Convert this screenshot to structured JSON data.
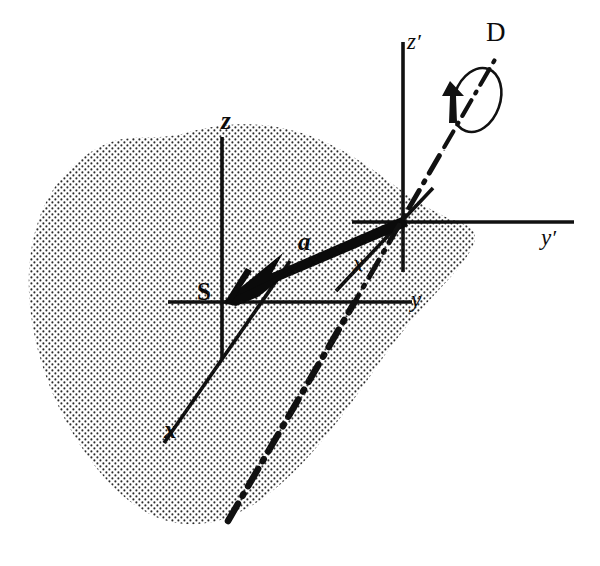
{
  "figure": {
    "background_color": "#ffffff",
    "ink_color": "#111111",
    "stipple_color": "#2b2b2b",
    "width": 600,
    "height": 566
  },
  "labels": {
    "origin_unprimed": "S",
    "axis_z_unprimed": "z",
    "axis_y_unprimed": "y",
    "axis_x_unprimed": "x",
    "axis_z_primed": "z",
    "axis_y_primed": "y",
    "axis_x_primed": "x",
    "prime_mark": "′",
    "vector_a": "a",
    "rotation_axis": "D"
  },
  "geometry": {
    "origin_unprimed": {
      "x": 222,
      "y": 302
    },
    "origin_primed": {
      "x": 403,
      "y": 222
    },
    "vector_a": {
      "tail": {
        "x": 403,
        "y": 222
      },
      "tip": {
        "x": 224,
        "y": 301
      },
      "label_pos": {
        "x": 300,
        "y": 232
      }
    },
    "axes_unprimed": {
      "z": {
        "from": {
          "x": 222,
          "y": 137
        },
        "to": {
          "x": 222,
          "y": 358
        }
      },
      "y": {
        "from": {
          "x": 168,
          "y": 302
        },
        "to": {
          "x": 412,
          "y": 302
        }
      },
      "x": {
        "from": {
          "x": 164,
          "y": 443
        },
        "to": {
          "x": 288,
          "y": 262
        }
      }
    },
    "axes_primed": {
      "z": {
        "from": {
          "x": 403,
          "y": 42
        },
        "to": {
          "x": 403,
          "y": 272
        }
      },
      "y": {
        "from": {
          "x": 352,
          "y": 222
        },
        "to": {
          "x": 574,
          "y": 222
        }
      },
      "x": {
        "from": {
          "x": 338,
          "y": 288
        },
        "to": {
          "x": 432,
          "y": 190
        }
      }
    },
    "rotation_axis_D": {
      "from": {
        "x": 228,
        "y": 521
      },
      "to": {
        "x": 497,
        "y": 56
      },
      "style": "dash-dot"
    },
    "rotation_ellipse": {
      "center": {
        "x": 477,
        "y": 100
      },
      "rx": 23,
      "ry": 33,
      "tilt_deg": 20
    }
  },
  "label_positions": {
    "S": {
      "x": 199,
      "y": 281
    },
    "z": {
      "x": 224,
      "y": 111
    },
    "y": {
      "x": 412,
      "y": 290
    },
    "x": {
      "x": 165,
      "y": 419
    },
    "z_primed": {
      "x": 408,
      "y": 32
    },
    "y_primed": {
      "x": 542,
      "y": 228
    },
    "x_primed": {
      "x": 352,
      "y": 254
    },
    "a": {
      "x": 297,
      "y": 230
    },
    "D": {
      "x": 487,
      "y": 20
    }
  }
}
